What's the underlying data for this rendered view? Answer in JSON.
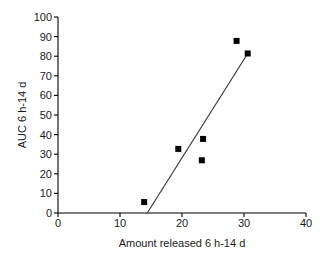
{
  "chart_data": {
    "type": "scatter",
    "title": "",
    "xlabel": "Amount released 6 h-14 d",
    "ylabel": "AUC 6 h-14 d",
    "xlim": [
      0,
      40
    ],
    "ylim": [
      0,
      100
    ],
    "xticks": [
      0,
      10,
      20,
      30,
      40
    ],
    "yticks": [
      0,
      10,
      20,
      30,
      40,
      50,
      60,
      70,
      80,
      90,
      100
    ],
    "grid": false,
    "legend": null,
    "marker": "filled-square",
    "marker_color": "#000000",
    "points": [
      {
        "x": 13.9,
        "y": 5.6
      },
      {
        "x": 19.4,
        "y": 32.7
      },
      {
        "x": 23.2,
        "y": 26.9
      },
      {
        "x": 23.4,
        "y": 37.8
      },
      {
        "x": 28.8,
        "y": 87.8
      },
      {
        "x": 30.6,
        "y": 81.4
      }
    ],
    "series": [
      {
        "name": "data",
        "x": [
          13.9,
          19.4,
          23.2,
          23.4,
          28.8,
          30.6
        ],
        "values": [
          5.6,
          32.7,
          26.9,
          37.8,
          87.8,
          81.4
        ]
      }
    ],
    "trendline": {
      "type": "line",
      "color": "#3a3a3a",
      "x": [
        14.4,
        30.6
      ],
      "y": [
        0.0,
        81.4
      ]
    }
  },
  "axis": {
    "x_tick_labels": [
      "0",
      "10",
      "20",
      "30",
      "40"
    ],
    "y_tick_labels": [
      "0",
      "10",
      "20",
      "30",
      "40",
      "50",
      "60",
      "70",
      "80",
      "90",
      "100"
    ],
    "x_title": "Amount released 6 h-14 d",
    "y_title": "AUC 6 h-14 d",
    "axis_color": "#000000"
  }
}
